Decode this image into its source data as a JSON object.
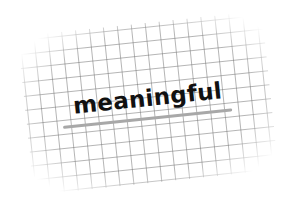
{
  "card": {
    "style": "graph-paper",
    "rotation_deg": -6,
    "grid_color": "#8a8a8a",
    "background_color": "#ffffff"
  },
  "word": {
    "text": "meaningful",
    "color": "#111111"
  },
  "underline": {
    "color": "#a8a8a8"
  }
}
